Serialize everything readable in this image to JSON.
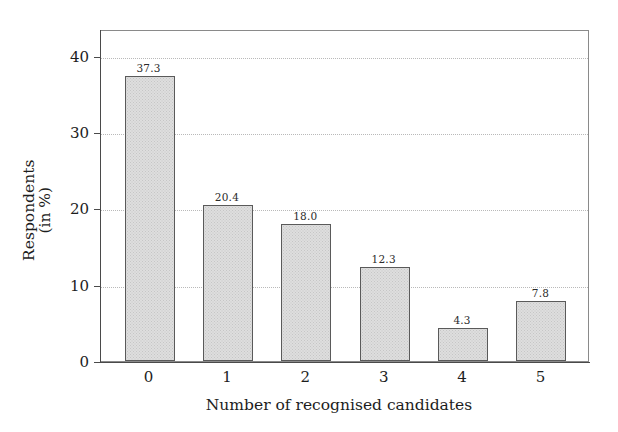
{
  "chart_data": {
    "type": "bar",
    "title": "",
    "subtitle": "",
    "categories": [
      "0",
      "1",
      "2",
      "3",
      "4",
      "5"
    ],
    "values": [
      37.3,
      20.4,
      18.0,
      12.3,
      4.3,
      7.8
    ],
    "value_labels": [
      "37.3",
      "20.4",
      "18.0",
      "12.3",
      "4.3",
      "7.8"
    ],
    "xlabel": "Number of recognised candidates",
    "ylabel": "Respondents (in %)",
    "ylabel_line1": "Respondents",
    "ylabel_line2": "(in %)",
    "yticks": [
      0,
      10,
      20,
      30,
      40
    ],
    "ytick_labels": [
      "0",
      "10",
      "20",
      "30",
      "40"
    ],
    "ylim": [
      0,
      43.5
    ],
    "xlim": [
      -0.62,
      5.62
    ],
    "grid": true,
    "grid_axis": "y",
    "grid_style": "dotted",
    "legend": false,
    "legend_position": "none",
    "series": [
      {
        "name": "Respondents",
        "values": [
          37.3,
          20.4,
          18.0,
          12.3,
          4.3,
          7.8
        ]
      }
    ],
    "colors": {
      "bar_fill": "#dedede",
      "bar_edge": "#5a5a5a",
      "axis": "#4a4a4a",
      "grid": "#b9b9b9",
      "text": "#1d1d1d",
      "background": "#ffffff",
      "plot_border": "#8a8a8a"
    }
  }
}
